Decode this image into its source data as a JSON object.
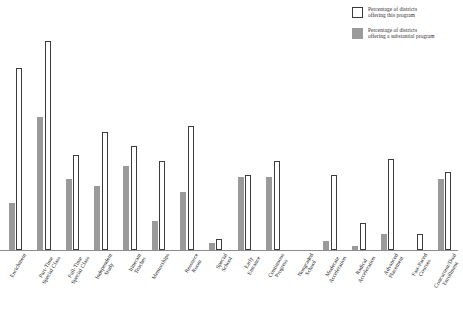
{
  "legend": {
    "position": "top-right",
    "entries": [
      {
        "swatch": "open-square-icon",
        "label": "Percentage of districts\noffering this program",
        "color": "#ffffff"
      },
      {
        "swatch": "filled-square-icon",
        "label": "Percentage of districts\noffering a substantial program",
        "color": "#9a9a9a"
      }
    ]
  },
  "chart_data": {
    "type": "bar",
    "title": "",
    "subtitle": "",
    "xlabel": "",
    "ylabel": "",
    "ylim": [
      0,
      100
    ],
    "grid": false,
    "legend_position": "top-right",
    "categories": [
      "Enrichment",
      "Part-Time Special Class",
      "Full-Time Special Class",
      "Independent Study",
      "Itinerant Teacher",
      "Mentorships",
      "Resource Room",
      "Special School",
      "Early Entrance",
      "Continuous Progress",
      "Nongraded School",
      "Moderate Acceleration",
      "Radical Acceleration",
      "Advanced Placement",
      "Fast-Paced Courses",
      "Concurrent/Dual Enrollment"
    ],
    "category_labels_wrapped": [
      "Enrichment",
      "Part-Time\nSpecial Class",
      "Full-Time\nSpecial Class",
      "Independent\nStudy",
      "Itinerant\nTeacher",
      "Mentorships",
      "Resource\nRoom",
      "Special\nSchool",
      "Early\nEntrance",
      "Continuous\nProgress",
      "Nongraded\nSchool",
      "Moderate\nAcceleration",
      "Radical\nAcceleration",
      "Advanced\nPlacement",
      "Fast-Paced\nCourses",
      "Concurrent/Dual\nEnrollment"
    ],
    "series": [
      {
        "name": "Percentage of districts offering a substantial program",
        "color": "#9a9a9a",
        "style": "filled",
        "values": [
          21,
          60,
          32,
          29,
          38,
          13,
          26,
          3,
          33,
          33,
          0,
          4,
          2,
          7,
          0,
          32
        ]
      },
      {
        "name": "Percentage of districts offering this program",
        "color": "#ffffff",
        "style": "outlined",
        "values": [
          82,
          94,
          43,
          53,
          47,
          40,
          56,
          5,
          34,
          40,
          0,
          34,
          12,
          41,
          7,
          35
        ]
      }
    ]
  }
}
